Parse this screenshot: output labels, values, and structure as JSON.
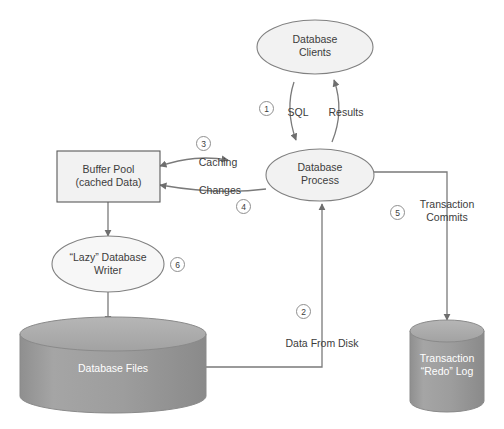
{
  "diagram": {
    "type": "flow-diagram",
    "colors": {
      "stroke": "#7a7a7a",
      "node_fill_light": "#f2f2f2",
      "cylinder_fill": "#9a9a9a",
      "cylinder_top_fill": "#b0b0b0",
      "text": "#3c3c3c",
      "text_on_fill": "#ffffff",
      "badge_border": "#8f8f8f"
    },
    "nodes": {
      "database_clients": {
        "shape": "ellipse",
        "line1": "Database",
        "line2": "Clients"
      },
      "database_process": {
        "shape": "ellipse",
        "line1": "Database",
        "line2": "Process"
      },
      "buffer_pool": {
        "shape": "rectangle",
        "line1": "Buffer Pool",
        "line2": "(cached Data)"
      },
      "lazy_writer": {
        "shape": "ellipse",
        "line1": "“Lazy” Database",
        "line2": "Writer"
      },
      "database_files": {
        "shape": "cylinder",
        "line1": "Database Files",
        "line2": ""
      },
      "transaction_log": {
        "shape": "cylinder",
        "line1": "Transaction",
        "line2": "“Redo” Log"
      }
    },
    "edges": {
      "sql": {
        "label": "SQL",
        "badge": "1",
        "from": "database_clients",
        "to": "database_process"
      },
      "results": {
        "label": "Results",
        "badge": "",
        "from": "database_process",
        "to": "database_clients"
      },
      "caching": {
        "label": "Caching",
        "badge": "3",
        "from": "database_process",
        "to": "buffer_pool"
      },
      "changes": {
        "label": "Changes",
        "badge": "4",
        "from": "database_process",
        "to": "buffer_pool"
      },
      "data_from_disk": {
        "label": "Data From Disk",
        "badge": "2",
        "from": "database_files",
        "to": "database_process"
      },
      "transaction_commits": {
        "label_line1": "Transaction",
        "label_line2": "Commits",
        "badge": "5",
        "from": "database_process",
        "to": "transaction_log"
      },
      "lazy_write": {
        "label": "",
        "badge": "6",
        "from": "buffer_pool",
        "to": "database_files"
      }
    }
  }
}
